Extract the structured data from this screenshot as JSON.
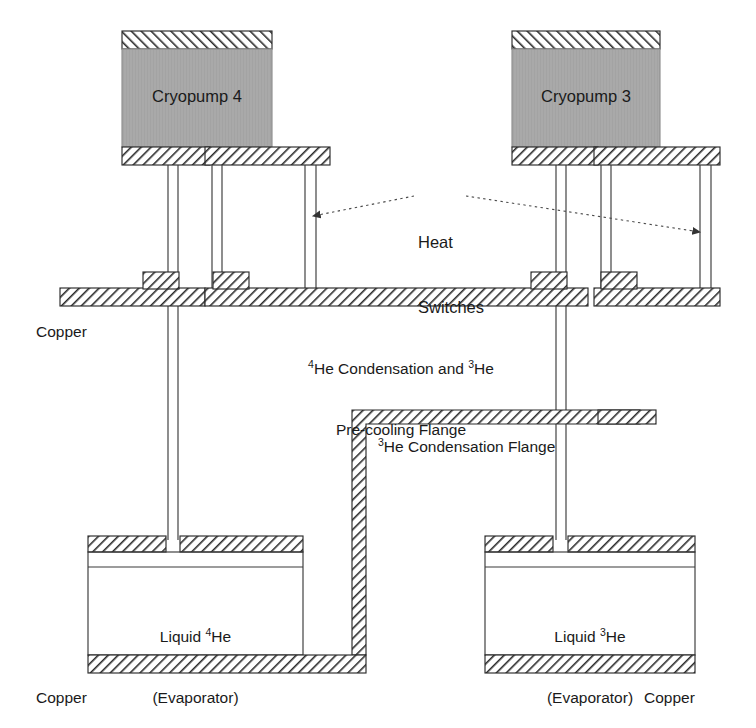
{
  "diagram": {
    "colors": {
      "line": "#3a3a3a",
      "hatch": "#2b2b2b",
      "pump_fill": "#a9a9a9",
      "text": "#1a1a1a",
      "background": "#ffffff",
      "leader": "#4a4a4a"
    },
    "labels": {
      "cryopump_left": "Cryopump 4",
      "cryopump_right": "Cryopump 3",
      "heat_switches_line1": "Heat",
      "heat_switches_line2": "Switches",
      "copper_left_mid": "Copper",
      "copper_left_bottom": "Copper",
      "copper_right_bottom": "Copper",
      "flange_mid_line1_pre": "",
      "flange_mid_line1_sup1": "4",
      "flange_mid_line1_a": "He Condensation and ",
      "flange_mid_line1_sup2": "3",
      "flange_mid_line1_b": "He",
      "flange_mid_line2": "Pre-cooling Flange",
      "he3_flange_sup": "3",
      "he3_flange_text": "He Condensation Flange",
      "evap_left_sup": "4",
      "evap_left_line1_pre": "Liquid ",
      "evap_left_line1_post": "He",
      "evap_left_line2": "(Evaporator)",
      "evap_right_sup": "3",
      "evap_right_line1_pre": "Liquid ",
      "evap_right_line1_post": "He",
      "evap_right_line2": "(Evaporator)"
    },
    "components": [
      {
        "name": "cryopump-4-body",
        "x": 122,
        "y": 52,
        "w": 150,
        "h": 94
      },
      {
        "name": "cryopump-4-top-flange",
        "x": 122,
        "y": 31,
        "w": 150,
        "h": 18
      },
      {
        "name": "cryopump-4-bottom-flange",
        "x": 122,
        "y": 146,
        "w": 88,
        "h": 18
      },
      {
        "name": "cryopump-3-body",
        "x": 512,
        "y": 52,
        "w": 148,
        "h": 94
      },
      {
        "name": "cryopump-3-top-flange",
        "x": 512,
        "y": 31,
        "w": 148,
        "h": 18
      },
      {
        "name": "cryopump-3-bottom-flange",
        "x": 512,
        "y": 146,
        "w": 86,
        "h": 18
      },
      {
        "name": "precooling-flange",
        "y": 288,
        "h": 18
      },
      {
        "name": "he3-condensation-flange",
        "y": 410,
        "h": 14
      },
      {
        "name": "liquid-he4-evaporator",
        "x": 88,
        "y": 535,
        "w": 215,
        "h": 120
      },
      {
        "name": "liquid-he3-evaporator",
        "x": 485,
        "y": 535,
        "w": 210,
        "h": 120
      }
    ]
  }
}
